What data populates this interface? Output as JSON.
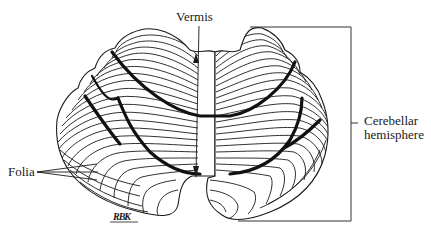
{
  "figure": {
    "colors": {
      "ink": "#1a1a1a",
      "background": "#ffffff"
    }
  },
  "labels": {
    "vermis": "Vermis",
    "hemisphere_line1": "Cerebellar",
    "hemisphere_line2": "hemisphere",
    "folia": "Folia",
    "signature": "RBK"
  }
}
